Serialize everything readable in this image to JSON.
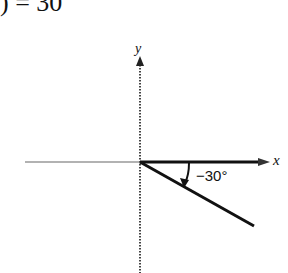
{
  "header_fragment": ") = 30",
  "diagram": {
    "type": "angle-on-coordinate-axes",
    "axes": {
      "x_label": "x",
      "y_label": "y"
    },
    "angle_label": "−30°",
    "angle_degrees": -30,
    "colors": {
      "ink": "#111111",
      "axis": "#555555",
      "background": "#ffffff"
    }
  }
}
